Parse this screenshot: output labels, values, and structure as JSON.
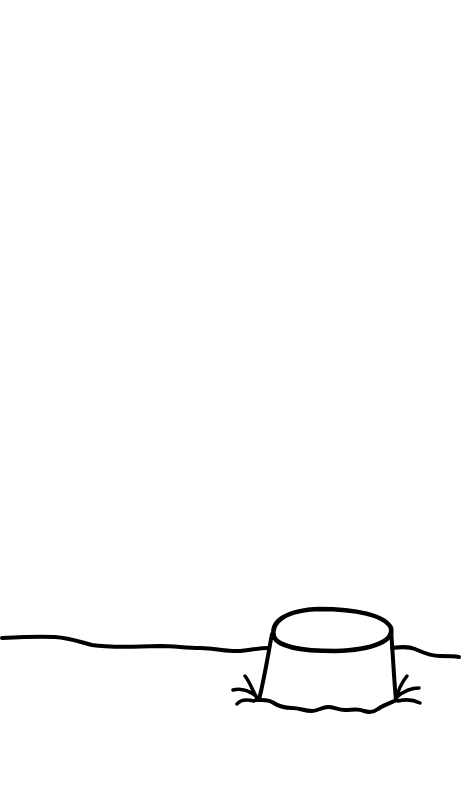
{
  "drawing": {
    "subject": "tree stump in ground",
    "background_color": "#ffffff",
    "ink_color": "#000000",
    "stroke_width": 4,
    "elements": [
      "ground-line-left",
      "ground-line-right",
      "stump-top-ellipse",
      "stump-left-side",
      "stump-right-side",
      "stump-base",
      "grass-tuft-left",
      "grass-tuft-right"
    ]
  }
}
